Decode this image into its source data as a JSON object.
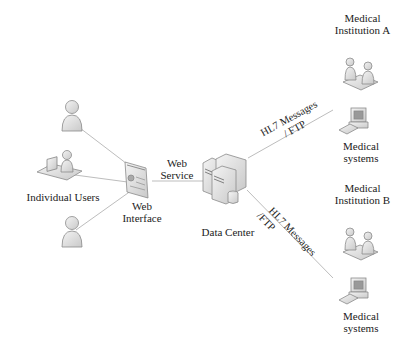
{
  "diagram": {
    "nodes": {
      "individual_users": {
        "label": "Individual Users",
        "icons": [
          "user-icon",
          "user-at-desk-icon",
          "user-icon"
        ]
      },
      "web_interface": {
        "label_line1": "Web",
        "label_line2": "Interface",
        "icon": "web-page-icon"
      },
      "web_service": {
        "label_line1": "Web",
        "label_line2": "Service"
      },
      "data_center": {
        "label": "Data Center",
        "icon": "server-cluster-icon"
      },
      "institution_a": {
        "title_line1": "Medical",
        "title_line2": "Institution A",
        "systems_line1": "Medical",
        "systems_line2": "systems",
        "icons": [
          "consultation-icon",
          "computer-icon"
        ]
      },
      "institution_b": {
        "title_line1": "Medical",
        "title_line2": "Institution B",
        "systems_line1": "Medical",
        "systems_line2": "systems",
        "icons": [
          "consultation-icon",
          "computer-icon"
        ]
      }
    },
    "edges": {
      "to_a": {
        "line1": "HL7  Messages",
        "line2": "/ FTP"
      },
      "to_b": {
        "line1": "HL7  Messages",
        "line2": "/FTP"
      }
    },
    "colors": {
      "line": "#b8b8b8",
      "icon_fill": "#e4e4e4",
      "icon_stroke": "#8a8a8a",
      "box_border": "#b5b5b5"
    }
  }
}
